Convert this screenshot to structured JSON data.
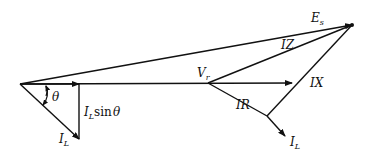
{
  "diagram": {
    "type": "phasor-diagram",
    "colors": {
      "line": "#111111",
      "background": "#ffffff"
    },
    "labels": {
      "Es": {
        "main": "E",
        "sub": "s"
      },
      "IZ": "IZ",
      "Vr": {
        "main": "V",
        "sub": "r"
      },
      "IX": "IX",
      "IR": "IR",
      "IL_right": {
        "main": "I",
        "sub": "L"
      },
      "IL_left": {
        "main": "I",
        "sub": "L"
      },
      "theta": "θ",
      "IL_sin_theta": {
        "main": "I",
        "sub": "L",
        "rest": "sin",
        "angle": "θ"
      }
    },
    "phasors": [
      {
        "name": "Es",
        "from": [
          20,
          84
        ],
        "to": [
          352,
          25
        ]
      },
      {
        "name": "Vr",
        "from": [
          20,
          84
        ],
        "to": [
          292,
          83
        ]
      },
      {
        "name": "IZ",
        "from": [
          208,
          83
        ],
        "to": [
          352,
          25
        ]
      },
      {
        "name": "IR",
        "from": [
          208,
          83
        ],
        "to": [
          267,
          116
        ]
      },
      {
        "name": "IX",
        "from": [
          267,
          116
        ],
        "to": [
          352,
          25
        ]
      },
      {
        "name": "IL_right",
        "from": [
          267,
          116
        ],
        "to": [
          285,
          136
        ]
      },
      {
        "name": "IL_left",
        "from": [
          20,
          84
        ],
        "to": [
          79,
          139
        ]
      },
      {
        "name": "IL_sin_theta",
        "from": [
          79,
          84
        ],
        "to": [
          79,
          139
        ]
      }
    ]
  }
}
